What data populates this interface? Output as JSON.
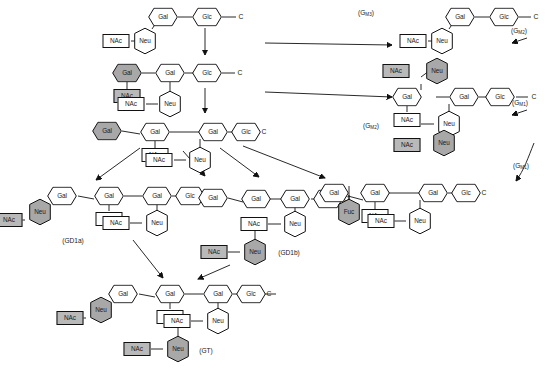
{
  "diagram": {
    "residue_labels": {
      "gal": "Gal",
      "glc": "Glc",
      "neu": "Neu",
      "nac": "NAc",
      "fuc": "Fuc",
      "ceramide": "C"
    },
    "colors": {
      "shaded_residue": "#a8a8a8",
      "shaded_box": "#b9b9b9",
      "outline": "#111111",
      "background": "#ffffff"
    }
  },
  "structures": [
    {
      "id": "gm2-top-left",
      "name": "GM2 (upper left precursor)",
      "label": "",
      "residues": [
        "Gal",
        "Glc",
        "C",
        "Neu",
        "NAc"
      ]
    },
    {
      "id": "gm1-mid-left",
      "name": "GM1 (middle left)",
      "label": "",
      "residues": [
        "Gal",
        "NAc",
        "Gal",
        "Glc",
        "C",
        "Neu",
        "NAc"
      ]
    },
    {
      "id": "gd1-upper-row3",
      "name": "Extended chain row 3",
      "label": "",
      "residues": [
        "Gal",
        "Gal",
        "NAc",
        "Gal",
        "Glc",
        "C",
        "Neu",
        "NAc"
      ]
    },
    {
      "id": "gd1a",
      "name": "GD1a",
      "label": "(GD1a)",
      "residues": [
        "Gal",
        "Neu",
        "NAc",
        "Gal",
        "NAc",
        "Gal",
        "Glc",
        "C",
        "Neu",
        "NAc"
      ]
    },
    {
      "id": "gd1b",
      "name": "GD1b",
      "label": "(GD1b)",
      "residues": [
        "Gal",
        "Gal",
        "Gal",
        "Glc",
        "C",
        "Neu",
        "NAc",
        "Neu",
        "NAc"
      ]
    },
    {
      "id": "fuc-gm1",
      "name": "Fucosyl-GM1",
      "label": "",
      "residues": [
        "Gal",
        "Fuc",
        "Gal",
        "NAc",
        "Gal",
        "Glc",
        "C",
        "Neu",
        "NAc"
      ]
    },
    {
      "id": "gm3-top-right",
      "name": "GM3 upper right",
      "label": "",
      "residues": [
        "Gal",
        "Glc",
        "C",
        "Neu",
        "NAc"
      ]
    },
    {
      "id": "gm2-right",
      "name": "GM2 right",
      "label": "",
      "residues": [
        "Neu",
        "NAc",
        "Gal",
        "NAc",
        "Gal",
        "Glc",
        "C",
        "Neu",
        "NAc"
      ]
    },
    {
      "id": "gt",
      "name": "GT",
      "label": "(GT)",
      "residues": [
        "Gal",
        "Neu",
        "NAc",
        "Gal",
        "NAc",
        "Gal",
        "Glc",
        "C",
        "Neu",
        "NAc",
        "Neu",
        "NAc"
      ]
    }
  ],
  "annotations": [
    {
      "id": "ann-gm3-topright",
      "text": "(G",
      "sub": "M3",
      "close": ")",
      "x": 366,
      "y": 14
    },
    {
      "id": "ann-gm2-topright",
      "text": "(G",
      "sub": "M2",
      "close": ")",
      "x": 519,
      "y": 32
    },
    {
      "id": "ann-gm1-right",
      "text": "(G",
      "sub": "M1",
      "close": ")",
      "x": 520,
      "y": 104
    },
    {
      "id": "ann-gm3-mid",
      "text": "(G",
      "sub": "M2",
      "close": ")",
      "x": 371,
      "y": 127
    },
    {
      "id": "ann-gm1-far",
      "text": "(G",
      "sub": "M1",
      "close": ")",
      "x": 521,
      "y": 167
    },
    {
      "id": "ann-gd1a",
      "text": "(GD1a)",
      "sub": "",
      "close": "",
      "x": 73,
      "y": 241
    },
    {
      "id": "ann-gd1b",
      "text": "(GD1b)",
      "sub": "",
      "close": "",
      "x": 289,
      "y": 253
    },
    {
      "id": "ann-gt",
      "text": "(GT)",
      "sub": "",
      "close": "",
      "x": 206,
      "y": 351
    }
  ]
}
